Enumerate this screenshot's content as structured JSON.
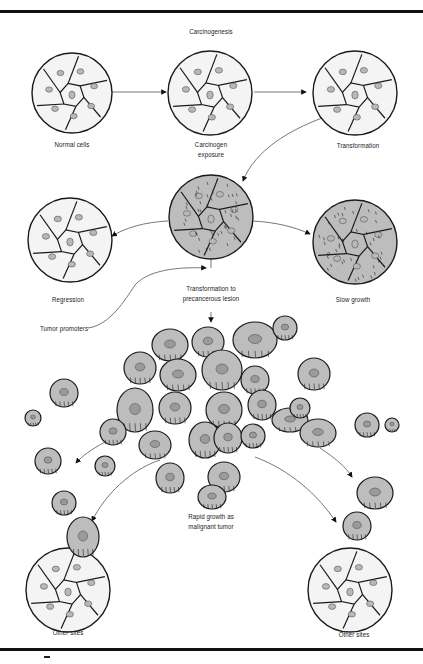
{
  "title": "Carcinogenesis",
  "stages": {
    "normal": "Normal cells",
    "exposure_line1": "Carcinogen",
    "exposure_line2": "exposure",
    "transformation": "Transformation",
    "regression": "Regression",
    "slow_growth": "Slow growth",
    "precancer_line1": "Transformation to",
    "precancer_line2": "precancerous lesion",
    "promoters": "Tumor promoters",
    "malignant_line1": "Rapid growth as",
    "malignant_line2": "malignant tumor",
    "other_sites_left": "Other sites",
    "other_sites_right": "Other sites"
  },
  "colors": {
    "normal_cell_fill": "#f4f4f4",
    "nucleus_fill": "#b8b8b8",
    "diseased_cell_fill": "#bdbdbd",
    "outline": "#1a1a1a",
    "arrow": "#555555"
  }
}
